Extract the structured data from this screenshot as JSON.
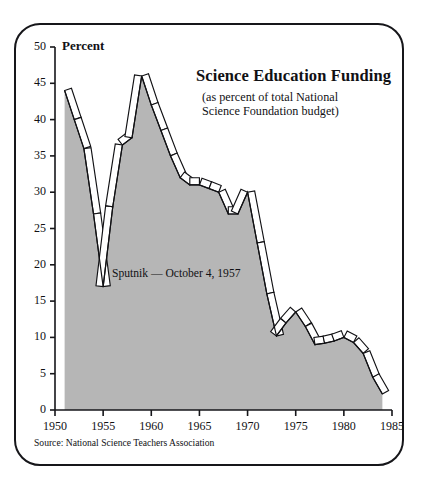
{
  "figure": {
    "source_note": "Source: National Science Teachers Association",
    "frame_style": "rounded-rectangle-border"
  },
  "chart_data": {
    "type": "area",
    "title": "Science Education Funding",
    "subtitle_line1": "(as percent of total National",
    "subtitle_line2": "Science Foundation budget)",
    "ylabel": "Percent",
    "xlabel": "",
    "xlim": [
      1950,
      1985
    ],
    "ylim": [
      0,
      50
    ],
    "grid": false,
    "legend": null,
    "yticks": [
      0,
      5,
      10,
      15,
      20,
      25,
      30,
      35,
      40,
      45,
      50
    ],
    "ytick_labels": [
      "0",
      "5",
      "10",
      "15",
      "20",
      "25",
      "30",
      "35",
      "40",
      "45",
      "50"
    ],
    "xticks": [
      1950,
      1955,
      1960,
      1965,
      1970,
      1975,
      1980,
      1985
    ],
    "xtick_labels": [
      "1950",
      "1955",
      "1960",
      "1965",
      "1970",
      "1975",
      "1980",
      "1985"
    ],
    "series": [
      {
        "name": "Science education as percent of NSF budget",
        "x": [
          1951,
          1952,
          1953,
          1954,
          1955,
          1956,
          1957,
          1958,
          1959,
          1960,
          1961,
          1962,
          1963,
          1964,
          1965,
          1966,
          1967,
          1968,
          1969,
          1970,
          1971,
          1972,
          1973,
          1974,
          1975,
          1976,
          1977,
          1978,
          1979,
          1980,
          1981,
          1982,
          1983,
          1984
        ],
        "values": [
          44.0,
          40.0,
          36.0,
          27.0,
          17.0,
          28.0,
          36.5,
          37.5,
          46.0,
          42.0,
          38.5,
          35.0,
          32.0,
          31.0,
          31.0,
          30.5,
          30.0,
          27.0,
          27.0,
          30.0,
          23.0,
          16.0,
          10.2,
          12.0,
          13.5,
          11.5,
          9.0,
          9.2,
          9.5,
          10.0,
          9.3,
          7.8,
          4.5,
          2.2
        ]
      }
    ],
    "annotations": [
      {
        "text": "Sputnik — October 4, 1957",
        "x": 1957,
        "y": 20
      }
    ],
    "colors": {
      "area_fill": "#b6b6b6",
      "line_stroke": "#111114",
      "ribbon_fill": "#ffffff",
      "axis": "#16161a",
      "text": "#111114",
      "background": "#ffffff"
    }
  }
}
